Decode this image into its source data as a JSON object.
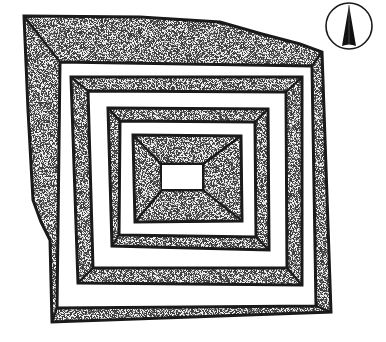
{
  "figure": {
    "title": "Stepped terrace structure plan view",
    "north_arrow": {
      "label": "N",
      "icon": "north-arrow-icon"
    },
    "colors": {
      "ink": "#1a1a1a",
      "stipple_dark": "#3a3a3a",
      "stipple_light": "#e8e8e8",
      "background": "#ffffff"
    },
    "rings": [
      {
        "name": "outer-enclosure",
        "level": 1
      },
      {
        "name": "second-terrace",
        "level": 2
      },
      {
        "name": "third-terrace",
        "level": 3
      },
      {
        "name": "central-platform",
        "level": 4
      }
    ],
    "center": {
      "name": "central-court",
      "fill": "none"
    }
  }
}
